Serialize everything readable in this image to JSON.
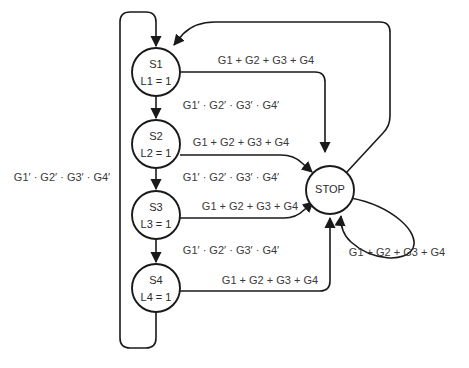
{
  "diagram": {
    "type": "state-transition-diagram",
    "title": "",
    "states": [
      {
        "id": "S1",
        "name": "S1",
        "output": "L1 = 1",
        "cx": 156,
        "cy": 72,
        "r": 24
      },
      {
        "id": "S2",
        "name": "S2",
        "output": "L2 = 1",
        "cx": 156,
        "cy": 144,
        "r": 24
      },
      {
        "id": "S3",
        "name": "S3",
        "output": "L3 = 1",
        "cx": 156,
        "cy": 215,
        "r": 24
      },
      {
        "id": "S4",
        "name": "S4",
        "output": "L4 = 1",
        "cx": 156,
        "cy": 288,
        "r": 24
      },
      {
        "id": "STOP",
        "name": "STOP",
        "output": "",
        "cx": 330,
        "cy": 190,
        "r": 24
      }
    ],
    "labels": {
      "sum_all": "G1 + G2 + G3 + G4",
      "product_all_primed": "G1′ · G2′ · G3′ · G4′"
    },
    "transitions": [
      {
        "id": "s1-stop",
        "from": "S1",
        "to": "STOP",
        "label": "G1 + G2 + G3 + G4",
        "label_x": 266,
        "label_y": 61
      },
      {
        "id": "s1-s2",
        "from": "S1",
        "to": "S2",
        "label": "G1′ · G2′ · G3′ · G4′",
        "label_x": 231,
        "label_y": 106
      },
      {
        "id": "s2-stop",
        "from": "S2",
        "to": "STOP",
        "label": "G1 + G2 + G3 + G4",
        "label_x": 241,
        "label_y": 143
      },
      {
        "id": "s2-s3",
        "from": "S2",
        "to": "S3",
        "label": "G1′ · G2′ · G3′ · G4′",
        "label_x": 231,
        "label_y": 178
      },
      {
        "id": "s3-stop",
        "from": "S3",
        "to": "STOP",
        "label": "G1 + G2 + G3 + G4",
        "label_x": 250,
        "label_y": 207
      },
      {
        "id": "s3-s4",
        "from": "S3",
        "to": "S4",
        "label": "G1′ · G2′ · G3′ · G4′",
        "label_x": 231,
        "label_y": 251
      },
      {
        "id": "s4-stop",
        "from": "S4",
        "to": "STOP",
        "label": "G1 + G2 + G3 + G4",
        "label_x": 270,
        "label_y": 281
      },
      {
        "id": "stop-self",
        "from": "STOP",
        "to": "STOP",
        "label": "G1 + G2 + G3 + G4",
        "label_x": 397,
        "label_y": 253
      },
      {
        "id": "stop-s1",
        "from": "STOP",
        "to": "S1",
        "label": "",
        "label_x": 0,
        "label_y": 0
      },
      {
        "id": "s4-s1-feedback",
        "from": "S4",
        "to": "S1",
        "label": "G1′ · G2′ · G3′ · G4′",
        "label_x": 62,
        "label_y": 178
      }
    ]
  }
}
